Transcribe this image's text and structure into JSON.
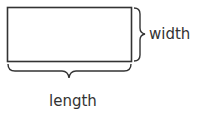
{
  "diagram": {
    "shape": "rectangle",
    "labels": {
      "width": "width",
      "length": "length"
    },
    "colors": {
      "stroke": "#333333",
      "text": "#333333",
      "background": "#ffffff"
    }
  }
}
